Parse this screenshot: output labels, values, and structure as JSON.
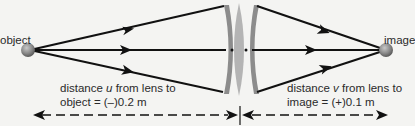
{
  "labels": {
    "object": "object",
    "image": "image"
  },
  "captions": {
    "u": {
      "line1_prefix": "distance ",
      "line1_var": "u",
      "line1_suffix": " from lens to",
      "line2": "object = (–)0.2 m"
    },
    "v": {
      "line1_prefix": "distance ",
      "line1_var": "v",
      "line1_suffix": " from lens to",
      "line2": "image = (+)0.1 m"
    }
  },
  "colors": {
    "background": "#f4f4f2",
    "ray": "#111111",
    "lens_outer": "#8c8c8c",
    "lens_inner": "#b4b4b4",
    "sphere": "#8a8a8a",
    "text": "#2a2a2a"
  },
  "values": {
    "object_distance_m": "(–)0.2",
    "image_distance_m": "(+)0.1"
  }
}
